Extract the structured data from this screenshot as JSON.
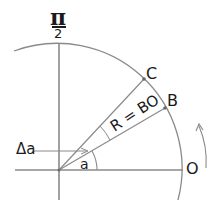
{
  "diagram": {
    "labels": {
      "pi": "π",
      "two": "2",
      "point_c": "C",
      "point_b": "B",
      "point_o": "O",
      "delta_a": "Δa",
      "angle_a": "a",
      "radius": "R = BO"
    },
    "colors": {
      "line": "#8a8a8a",
      "text": "#1a1a1a",
      "background": "#ffffff"
    }
  }
}
